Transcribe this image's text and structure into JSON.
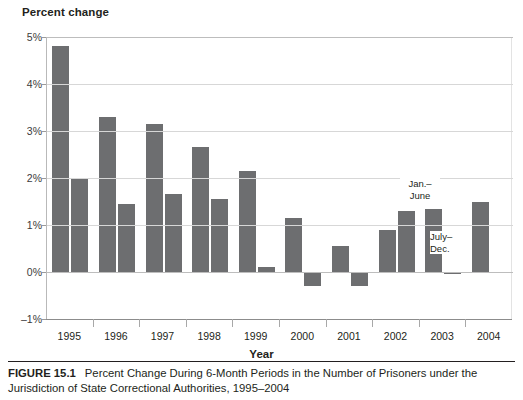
{
  "figure": {
    "number_label": "FIGURE 15.1",
    "caption": "Percent Change During 6-Month Periods in the Number of Prisoners under the Jurisdiction of State Correctional Authorities, 1995–2004"
  },
  "axes": {
    "ytitle": "Percent change",
    "xtitle": "Year",
    "yticks": [
      "5%",
      "4%",
      "3%",
      "2%",
      "1%",
      "0%",
      "–1%"
    ],
    "xticks": [
      "1995",
      "1996",
      "1997",
      "1998",
      "1999",
      "2000",
      "2001",
      "2002",
      "2003",
      "2004"
    ]
  },
  "annotations": [
    {
      "name": "jan-june-label",
      "line1": "Jan.–",
      "line2": "June"
    },
    {
      "name": "july-dec-label",
      "line1": "July–",
      "line2": "Dec."
    }
  ],
  "colors": {
    "bar": "#6d6e70",
    "grid": "#d7d7d7",
    "axis": "#8c8c8c",
    "text": "#231f20"
  },
  "chart_data": {
    "type": "bar",
    "title": "Percent Change During 6-Month Periods in the Number of Prisoners under the Jurisdiction of State Correctional Authorities, 1995–2004",
    "xlabel": "Year",
    "ylabel": "Percent change",
    "ylim": [
      -1,
      5
    ],
    "ytick_values": [
      5,
      4,
      3,
      2,
      1,
      0,
      -1
    ],
    "ytick_labels": [
      "5%",
      "4%",
      "3%",
      "2%",
      "1%",
      "0%",
      "–1%"
    ],
    "grid": true,
    "legend": "none",
    "categories": [
      "1995",
      "1996",
      "1997",
      "1998",
      "1999",
      "2000",
      "2001",
      "2002",
      "2003",
      "2004"
    ],
    "series": [
      {
        "name": "Jan.–June",
        "values": [
          4.8,
          3.3,
          3.15,
          2.65,
          2.15,
          1.15,
          0.55,
          0.9,
          1.35,
          1.5
        ]
      },
      {
        "name": "July–Dec.",
        "values": [
          2.0,
          1.45,
          1.65,
          1.55,
          0.1,
          -0.3,
          -0.3,
          1.3,
          -0.05,
          null
        ]
      }
    ],
    "bars": [
      {
        "year": "1995",
        "period": "Jan.–June",
        "value": 4.8
      },
      {
        "year": "1995",
        "period": "July–Dec.",
        "value": 2.0
      },
      {
        "year": "1996",
        "period": "Jan.–June",
        "value": 3.3
      },
      {
        "year": "1996",
        "period": "July–Dec.",
        "value": 1.45
      },
      {
        "year": "1997",
        "period": "Jan.–June",
        "value": 3.15
      },
      {
        "year": "1997",
        "period": "July–Dec.",
        "value": 1.65
      },
      {
        "year": "1998",
        "period": "Jan.–June",
        "value": 2.65
      },
      {
        "year": "1998",
        "period": "July–Dec.",
        "value": 1.55
      },
      {
        "year": "1999",
        "period": "Jan.–June",
        "value": 2.15
      },
      {
        "year": "1999",
        "period": "July–Dec.",
        "value": 0.1
      },
      {
        "year": "2000",
        "period": "Jan.–June",
        "value": 1.15
      },
      {
        "year": "2000",
        "period": "July–Dec.",
        "value": -0.3
      },
      {
        "year": "2001",
        "period": "Jan.–June",
        "value": 0.55
      },
      {
        "year": "2001",
        "period": "July–Dec.",
        "value": -0.3
      },
      {
        "year": "2002",
        "period": "Jan.–June",
        "value": 0.9
      },
      {
        "year": "2002",
        "period": "July–Dec.",
        "value": 1.3
      },
      {
        "year": "2003",
        "period": "Jan.–June",
        "value": 1.35
      },
      {
        "year": "2003",
        "period": "July–Dec.",
        "value": -0.05
      },
      {
        "year": "2004",
        "period": "Jan.–June",
        "value": 1.5
      }
    ]
  }
}
